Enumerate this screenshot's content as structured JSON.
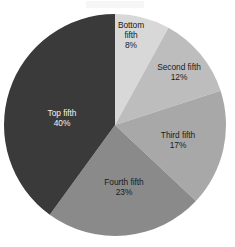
{
  "chart_data": {
    "type": "pie",
    "title": "",
    "subtitle": "",
    "xlabel": "",
    "ylabel": "",
    "legend_position": "none",
    "grid": false,
    "start_angle_deg": 0,
    "direction": "clockwise",
    "units": "percent",
    "total": 100,
    "categories": [
      "Bottom fifth",
      "Second fifth",
      "Third fifth",
      "Fourth fifth",
      "Top fifth"
    ],
    "values": [
      8,
      12,
      17,
      23,
      40
    ],
    "value_labels": [
      "8%",
      "12%",
      "17%",
      "23%",
      "40%"
    ],
    "colors": [
      "#d8d8d8",
      "#bdbdbd",
      "#a8a8a8",
      "#8a8a8a",
      "#3a3a3a"
    ],
    "slices": [
      {
        "name": "Bottom fifth",
        "label_line1": "Bottom",
        "label_line2": "fifth",
        "value": 8,
        "value_label": "8%",
        "color": "#d8d8d8",
        "text_color": "#1b1b1b",
        "label_x": 131,
        "label_y": 36
      },
      {
        "name": "Second fifth",
        "label_line1": "Second fifth",
        "label_line2": "",
        "value": 12,
        "value_label": "12%",
        "color": "#bdbdbd",
        "text_color": "#1b1b1b",
        "label_x": 179,
        "label_y": 73
      },
      {
        "name": "Third fifth",
        "label_line1": "Third fifth",
        "label_line2": "",
        "value": 17,
        "value_label": "17%",
        "color": "#a8a8a8",
        "text_color": "#1b1b1b",
        "label_x": 178,
        "label_y": 141
      },
      {
        "name": "Fourth fifth",
        "label_line1": "Fourth fifth",
        "label_line2": "",
        "value": 23,
        "value_label": "23%",
        "color": "#8a8a8a",
        "text_color": "#1b1b1b",
        "label_x": 124,
        "label_y": 188
      },
      {
        "name": "Top fifth",
        "label_line1": "Top fifth",
        "label_line2": "",
        "value": 40,
        "value_label": "40%",
        "color": "#3a3a3a",
        "text_color": "#f2f2f2",
        "label_x": 62,
        "label_y": 119
      }
    ],
    "geometry": {
      "center_x": 115,
      "center_y": 125,
      "radius": 111
    },
    "background_color": "#ffffff"
  }
}
